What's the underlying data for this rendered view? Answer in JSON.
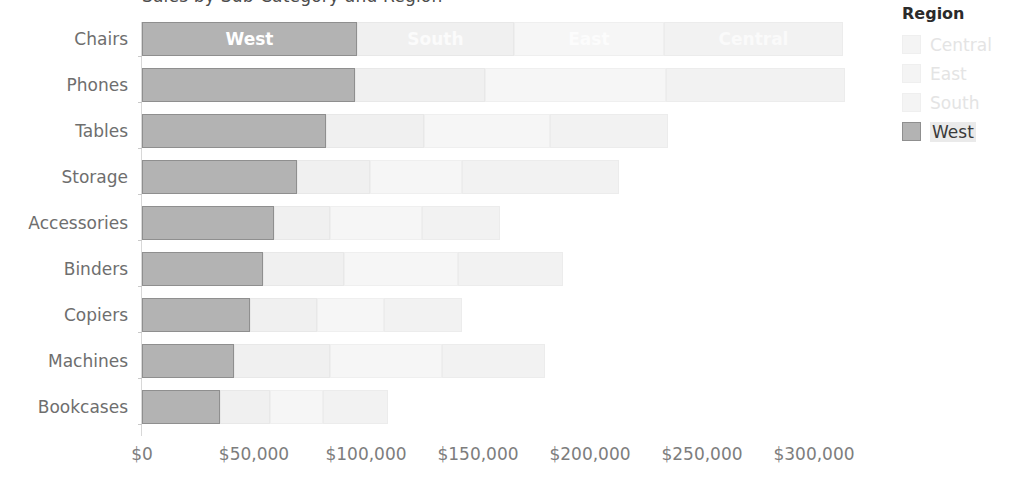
{
  "chart_data": {
    "type": "bar",
    "title": "Sales by Sub-Category and Region",
    "subtype": "stacked-horizontal-bar",
    "xlabel": "",
    "ylabel": "",
    "xlim": [
      0,
      325000
    ],
    "grid": false,
    "legend_position": "right",
    "categories": [
      "Chairs",
      "Phones",
      "Tables",
      "Storage",
      "Accessories",
      "Binders",
      "Copiers",
      "Machines",
      "Bookcases"
    ],
    "series": [
      {
        "name": "West",
        "values": [
          96000,
          95000,
          82000,
          69000,
          59000,
          54000,
          48000,
          41000,
          35000
        ]
      },
      {
        "name": "South",
        "values": [
          70000,
          58000,
          44000,
          33000,
          25000,
          36000,
          30000,
          43000,
          22000
        ]
      },
      {
        "name": "East",
        "values": [
          67000,
          81000,
          56000,
          41000,
          41000,
          51000,
          30000,
          50000,
          24000
        ]
      },
      {
        "name": "Central",
        "values": [
          80000,
          80000,
          53000,
          70000,
          35000,
          47000,
          35000,
          46000,
          29000
        ]
      }
    ],
    "totals": [
      313000,
      314000,
      235000,
      213000,
      160000,
      188000,
      143000,
      180000,
      110000
    ],
    "xticks": [
      "$0",
      "$50,000",
      "$100,000",
      "$150,000",
      "$200,000",
      "$250,000",
      "$300,000"
    ],
    "xtick_values": [
      0,
      50000,
      100000,
      150000,
      200000,
      250000,
      300000
    ],
    "segment_labels_row": "Chairs",
    "segment_labels": [
      "West",
      "South",
      "East",
      "Central"
    ],
    "colors": {
      "West": "#b3b3b3",
      "South": "#f0f0f0",
      "East": "#f6f6f6",
      "Central": "#f2f2f2",
      "axis": "#d8d8d8",
      "tick_text": "#7d7d7d",
      "category_text": "#6e6e6e"
    }
  },
  "legend": {
    "title": "Region",
    "items": [
      {
        "label": "Central",
        "state": "faded"
      },
      {
        "label": "East",
        "state": "faded"
      },
      {
        "label": "South",
        "state": "faded"
      },
      {
        "label": "West",
        "state": "active"
      }
    ]
  }
}
